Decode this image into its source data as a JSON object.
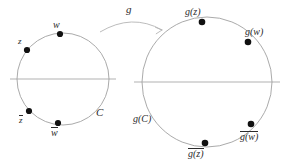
{
  "figure": {
    "type": "math-diagram",
    "background_color": "#ffffff",
    "stroke_color": "#9a9a9a",
    "point_color": "#111111",
    "text_color": "#2b2b2b"
  },
  "left_diagram": {
    "circle_label": "C",
    "points": [
      {
        "id": "w-top",
        "label": "w",
        "overline": false
      },
      {
        "id": "z-upper",
        "label": "z",
        "overline": false
      },
      {
        "id": "z-lower",
        "label": "z",
        "overline": true
      },
      {
        "id": "w-bottom",
        "label": "w",
        "overline": true
      }
    ]
  },
  "arrow": {
    "label": "g"
  },
  "right_diagram": {
    "circle_label": "g(C)",
    "points": [
      {
        "id": "gz-top",
        "label": "g(z)",
        "overline": false
      },
      {
        "id": "gw-upper",
        "label": "g(w)",
        "overline": false
      },
      {
        "id": "gw-lower",
        "label": "g(w)",
        "overline": true
      },
      {
        "id": "gz-bottom",
        "label": "g(z)",
        "overline": true
      }
    ]
  }
}
